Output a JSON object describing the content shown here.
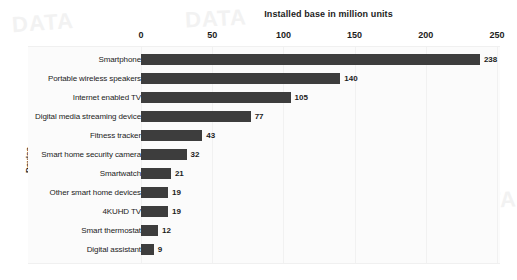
{
  "chart_data": {
    "type": "bar",
    "orientation": "horizontal",
    "title": "Installed base in million units",
    "xlabel": "Installed base in million units",
    "ylabel": "Device",
    "categories": [
      "Smartphone",
      "Portable wireless speakers",
      "Internet enabled TV",
      "Digital media streaming device",
      "Fitness tracker",
      "Smart home security camera",
      "Smartwatch",
      "Other smart home devices",
      "4KUHD TV",
      "Smart thermostat",
      "Digital assistant"
    ],
    "values": [
      238,
      140,
      105,
      77,
      43,
      32,
      21,
      19,
      19,
      12,
      9
    ],
    "value_labels": [
      "238",
      "140",
      "105",
      "77",
      "43",
      "32",
      "21",
      "19",
      "19",
      "12",
      "9"
    ],
    "xticks": [
      0,
      50,
      100,
      150,
      200,
      250
    ],
    "xtick_labels": [
      "0",
      "50",
      "100",
      "150",
      "200",
      "250"
    ],
    "xlim": [
      0,
      250
    ],
    "grid": true,
    "legend": false,
    "bar_color": "#3d3d3d",
    "plot_background": "#fbfbfb",
    "text_color": "#1c1c1c"
  },
  "watermark": {
    "a": "DATA",
    "b": "DATA",
    "c": "DATA"
  }
}
